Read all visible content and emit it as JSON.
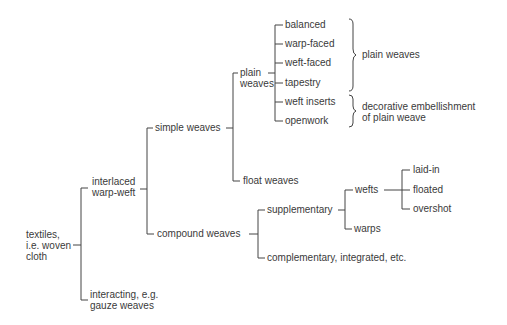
{
  "diagram": {
    "type": "tree",
    "root": {
      "label_lines": [
        "textiles,",
        "i.e. woven",
        "cloth"
      ]
    },
    "level1": {
      "interlaced": {
        "label_lines": [
          "interlaced",
          "warp-weft"
        ]
      },
      "interacting": {
        "label_lines": [
          "interacting, e.g.",
          "gauze weaves"
        ]
      }
    },
    "level2": {
      "simple": "simple weaves",
      "compound": "compound weaves"
    },
    "level3": {
      "plain": {
        "label_lines": [
          "plain",
          "weaves"
        ]
      },
      "float": "float weaves",
      "supplementary": "supplementary",
      "complementary": "complementary, integrated, etc."
    },
    "plain_leaves": [
      "balanced",
      "warp-faced",
      "weft-faced",
      "tapestry",
      "weft inserts",
      "openwork"
    ],
    "brackets": {
      "plain_weaves": "plain weaves",
      "decorative": [
        "decorative embellishment",
        "of plain weave"
      ]
    },
    "supplementary_children": {
      "wefts": "wefts",
      "warps": "warps"
    },
    "weft_leaves": [
      "laid-in",
      "floated",
      "overshot"
    ]
  }
}
